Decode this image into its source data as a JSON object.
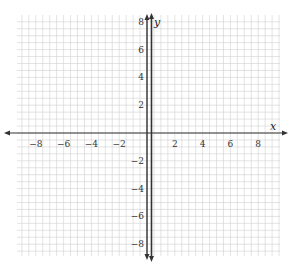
{
  "chart_data": {
    "type": "line",
    "title": "",
    "xlabel": "x",
    "ylabel": "y",
    "xlim": [
      -9.5,
      9.5
    ],
    "ylim": [
      -9,
      9
    ],
    "grid": true,
    "grid_minor_step": 0.5,
    "x_ticks": [
      -8,
      -6,
      -4,
      -2,
      2,
      4,
      6,
      8
    ],
    "y_ticks": [
      8,
      6,
      4,
      2,
      -2,
      -4,
      -6,
      -8
    ],
    "x_tick_labels": [
      "−8",
      "−6",
      "−4",
      "−2",
      "2",
      "4",
      "6",
      "8"
    ],
    "y_tick_labels": [
      "8",
      "6",
      "4",
      "2",
      "−2",
      "−4",
      "−6",
      "−8"
    ],
    "series": [
      {
        "name": "vertical line",
        "x": [
          0.25,
          0.25
        ],
        "y": [
          -9,
          9
        ],
        "color": "#333333"
      }
    ]
  },
  "labels": {
    "x_axis": "x",
    "y_axis": "y"
  },
  "colors": {
    "grid": "#d0d0d0",
    "axis": "#333333",
    "line": "#333333"
  }
}
